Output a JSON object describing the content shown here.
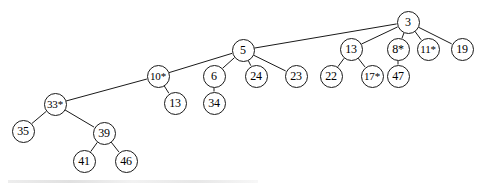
{
  "diagram": {
    "type": "tree",
    "canvas": {
      "width": 480,
      "height": 186
    },
    "style": {
      "node_fill": "#ffffff",
      "node_stroke": "#1a1a1a",
      "edge_color": "#1a1a1a",
      "text_color": "#000000"
    },
    "nodes": [
      {
        "id": "n3",
        "label": "3",
        "x": 408,
        "y": 22,
        "r": 11.5,
        "font_size": 12
      },
      {
        "id": "n5",
        "label": "5",
        "x": 243,
        "y": 50,
        "r": 11.5,
        "font_size": 12
      },
      {
        "id": "n13a",
        "label": "13",
        "x": 351,
        "y": 49,
        "r": 11.5,
        "font_size": 12
      },
      {
        "id": "n8",
        "label": "8*",
        "x": 398,
        "y": 49,
        "r": 11.5,
        "font_size": 12
      },
      {
        "id": "n11",
        "label": "11*",
        "x": 428,
        "y": 49,
        "r": 11.5,
        "font_size": 11
      },
      {
        "id": "n19",
        "label": "19",
        "x": 462,
        "y": 49,
        "r": 11.5,
        "font_size": 12
      },
      {
        "id": "n10",
        "label": "10*",
        "x": 158,
        "y": 76,
        "r": 11.5,
        "font_size": 11
      },
      {
        "id": "n6",
        "label": "6",
        "x": 214,
        "y": 76,
        "r": 11.5,
        "font_size": 12
      },
      {
        "id": "n24",
        "label": "24",
        "x": 256,
        "y": 76,
        "r": 11.5,
        "font_size": 12
      },
      {
        "id": "n23",
        "label": "23",
        "x": 296,
        "y": 76,
        "r": 11.5,
        "font_size": 12
      },
      {
        "id": "n22",
        "label": "22",
        "x": 331,
        "y": 76,
        "r": 11.5,
        "font_size": 12
      },
      {
        "id": "n17",
        "label": "17*",
        "x": 372,
        "y": 76,
        "r": 11.5,
        "font_size": 11
      },
      {
        "id": "n47",
        "label": "47",
        "x": 398,
        "y": 76,
        "r": 11.5,
        "font_size": 12
      },
      {
        "id": "n13b",
        "label": "13",
        "x": 175,
        "y": 103,
        "r": 11.5,
        "font_size": 12
      },
      {
        "id": "n34",
        "label": "34",
        "x": 214,
        "y": 103,
        "r": 11.5,
        "font_size": 12
      },
      {
        "id": "n33",
        "label": "33*",
        "x": 55,
        "y": 104,
        "r": 11.5,
        "font_size": 11
      },
      {
        "id": "n35",
        "label": "35",
        "x": 23,
        "y": 131,
        "r": 11.5,
        "font_size": 12
      },
      {
        "id": "n39",
        "label": "39",
        "x": 104,
        "y": 133,
        "r": 11.5,
        "font_size": 12
      },
      {
        "id": "n41",
        "label": "41",
        "x": 84,
        "y": 161,
        "r": 11.5,
        "font_size": 12
      },
      {
        "id": "n46",
        "label": "46",
        "x": 126,
        "y": 161,
        "r": 11.5,
        "font_size": 12
      }
    ],
    "edges": [
      {
        "from": "n3",
        "to": "n5"
      },
      {
        "from": "n3",
        "to": "n13a"
      },
      {
        "from": "n3",
        "to": "n8"
      },
      {
        "from": "n3",
        "to": "n11"
      },
      {
        "from": "n3",
        "to": "n19"
      },
      {
        "from": "n5",
        "to": "n10"
      },
      {
        "from": "n5",
        "to": "n6"
      },
      {
        "from": "n5",
        "to": "n24"
      },
      {
        "from": "n5",
        "to": "n23"
      },
      {
        "from": "n13a",
        "to": "n22"
      },
      {
        "from": "n13a",
        "to": "n17"
      },
      {
        "from": "n8",
        "to": "n47"
      },
      {
        "from": "n10",
        "to": "n13b"
      },
      {
        "from": "n10",
        "to": "n33"
      },
      {
        "from": "n6",
        "to": "n34"
      },
      {
        "from": "n33",
        "to": "n35"
      },
      {
        "from": "n33",
        "to": "n39"
      },
      {
        "from": "n39",
        "to": "n41"
      },
      {
        "from": "n39",
        "to": "n46"
      }
    ]
  }
}
